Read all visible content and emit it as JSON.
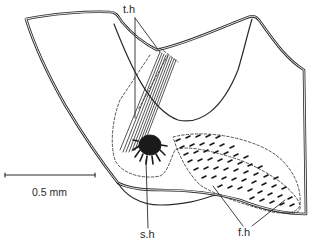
{
  "figure": {
    "type": "anatomical line drawing",
    "labels": {
      "tactile_hairs": "t.h",
      "sensory_hairs": "s.h",
      "fine_hairs": "f.h"
    },
    "scale_bar": {
      "label": "0.5 mm"
    },
    "colors": {
      "ink": "#2a2a2a",
      "background": "#ffffff"
    }
  }
}
